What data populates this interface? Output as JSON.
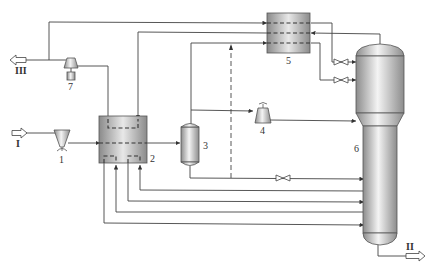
{
  "diagram": {
    "type": "process-flow-diagram",
    "colors": {
      "line": "#444444",
      "equipment_dark": "#8a8a8a",
      "equipment_light": "#f2f2f2",
      "background": "#ffffff"
    },
    "streams": {
      "feed": {
        "label": "I"
      },
      "product": {
        "label": "II"
      },
      "vent": {
        "label": "III"
      }
    },
    "equipment": [
      {
        "id": "1",
        "label": "1",
        "kind": "pump"
      },
      {
        "id": "2",
        "label": "2",
        "kind": "heat-exchanger"
      },
      {
        "id": "3",
        "label": "3",
        "kind": "separator-vessel"
      },
      {
        "id": "4",
        "label": "4",
        "kind": "compressor"
      },
      {
        "id": "5",
        "label": "5",
        "kind": "heat-exchanger"
      },
      {
        "id": "6",
        "label": "6",
        "kind": "reactor-column"
      },
      {
        "id": "7",
        "label": "7",
        "kind": "compressor-with-motor"
      }
    ]
  }
}
